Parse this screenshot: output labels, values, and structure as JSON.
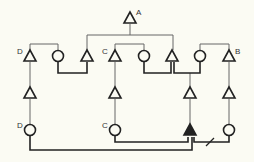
{
  "diagram": {
    "type": "pedigree",
    "colors": {
      "background": "#fbfbf3",
      "line": "#555555",
      "line_dark": "#222222",
      "symbol": "#222222"
    },
    "nodes": [
      {
        "id": "A",
        "shape": "triangle",
        "filled": false,
        "x": 130,
        "y": 18,
        "label": "A"
      },
      {
        "id": "r1_1",
        "shape": "triangle",
        "filled": false,
        "x": 30,
        "y": 56,
        "label": "D"
      },
      {
        "id": "r1_2",
        "shape": "circle",
        "filled": false,
        "x": 58,
        "y": 56,
        "label": ""
      },
      {
        "id": "r1_3",
        "shape": "triangle",
        "filled": false,
        "x": 87,
        "y": 56,
        "label": ""
      },
      {
        "id": "r1_4",
        "shape": "triangle",
        "filled": false,
        "x": 115,
        "y": 56,
        "label": "C"
      },
      {
        "id": "r1_5",
        "shape": "circle",
        "filled": false,
        "x": 144,
        "y": 56,
        "label": ""
      },
      {
        "id": "r1_6",
        "shape": "triangle",
        "filled": false,
        "x": 172,
        "y": 56,
        "label": ""
      },
      {
        "id": "r1_7",
        "shape": "circle",
        "filled": false,
        "x": 200,
        "y": 56,
        "label": ""
      },
      {
        "id": "r1_8",
        "shape": "triangle",
        "filled": false,
        "x": 229,
        "y": 56,
        "label": "B"
      },
      {
        "id": "r2_1",
        "shape": "triangle",
        "filled": false,
        "x": 30,
        "y": 93,
        "label": ""
      },
      {
        "id": "r2_2",
        "shape": "triangle",
        "filled": false,
        "x": 115,
        "y": 93,
        "label": ""
      },
      {
        "id": "r2_3",
        "shape": "triangle",
        "filled": false,
        "x": 190,
        "y": 93,
        "label": ""
      },
      {
        "id": "r2_4",
        "shape": "triangle",
        "filled": false,
        "x": 229,
        "y": 93,
        "label": ""
      },
      {
        "id": "r3_1",
        "shape": "circle",
        "filled": false,
        "x": 30,
        "y": 130,
        "label": "D"
      },
      {
        "id": "r3_2",
        "shape": "circle",
        "filled": false,
        "x": 115,
        "y": 130,
        "label": "C"
      },
      {
        "id": "r3_3",
        "shape": "triangle",
        "filled": true,
        "x": 190,
        "y": 130,
        "label": ""
      },
      {
        "id": "r3_4",
        "shape": "circle",
        "filled": false,
        "x": 229,
        "y": 130,
        "label": ""
      }
    ],
    "labels": [
      {
        "text": "A",
        "x": 136,
        "y": 9
      },
      {
        "text": "D",
        "x": 17,
        "y": 48
      },
      {
        "text": "C",
        "x": 102,
        "y": 48
      },
      {
        "text": "B",
        "x": 235,
        "y": 48
      },
      {
        "text": "D",
        "x": 17,
        "y": 122
      },
      {
        "text": "C",
        "x": 102,
        "y": 122
      }
    ]
  }
}
